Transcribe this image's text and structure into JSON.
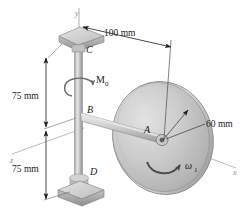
{
  "figure": {
    "background": "#ffffff",
    "colors": {
      "metal_light": "#dcdcdc",
      "metal_mid": "#c4c4c4",
      "metal_dark": "#9a9a9a",
      "disk_face": "#cfcfcf",
      "disk_edge": "#8f8f8f",
      "line": "#1a1a1a",
      "axis_line": "#a8a8a8",
      "arrow_dark": "#3a3a3a"
    }
  },
  "axes": [
    {
      "name": "y-axis",
      "label": "y"
    },
    {
      "name": "x-axis",
      "label": "x"
    },
    {
      "name": "z-axis",
      "label": "z"
    }
  ],
  "dimensions": [
    {
      "name": "horizontal-offset",
      "label": "100 mm",
      "value": 100,
      "unit": "mm"
    },
    {
      "name": "upper-segment",
      "label": "75 mm",
      "value": 75,
      "unit": "mm"
    },
    {
      "name": "lower-segment",
      "label": "75 mm",
      "value": 75,
      "unit": "mm"
    },
    {
      "name": "disk-radius",
      "label": "60 mm",
      "value": 60,
      "unit": "mm"
    }
  ],
  "points": [
    {
      "name": "point-c",
      "label": "C"
    },
    {
      "name": "point-b",
      "label": "B"
    },
    {
      "name": "point-d",
      "label": "D"
    },
    {
      "name": "point-a",
      "label": "A"
    }
  ],
  "vectors": [
    {
      "name": "applied-moment",
      "label": "M",
      "sub": "0"
    },
    {
      "name": "disk-spin-rate",
      "label": "ω",
      "sub": "1"
    }
  ]
}
